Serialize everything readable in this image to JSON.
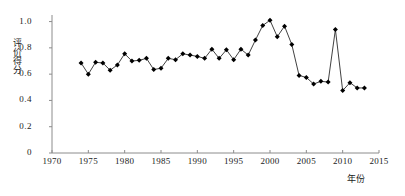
{
  "chart_data": {
    "type": "line",
    "title": "",
    "xlabel": "年份",
    "ylabel": "评价得分",
    "xlim": [
      1970,
      2015
    ],
    "ylim": [
      0,
      1.05
    ],
    "xticks": [
      1970,
      1975,
      1980,
      1985,
      1990,
      1995,
      2000,
      2005,
      2010,
      2015
    ],
    "xtick_labels": [
      "1970",
      "1975",
      "1980",
      "1985",
      "1990",
      "1995",
      "2000",
      "2005",
      "2010",
      "2015"
    ],
    "yticks": [
      0,
      0.2,
      0.4,
      0.6,
      0.8,
      1.0
    ],
    "ytick_labels": [
      "0",
      "0.2",
      "0.4",
      "0.6",
      "0.8",
      "1.0"
    ],
    "grid": false,
    "legend": null,
    "marker": "diamond",
    "marker_color": "#000000",
    "line_color": "#2b2b2b",
    "series": [
      {
        "name": "评价得分",
        "x": [
          1974,
          1975,
          1976,
          1977,
          1978,
          1979,
          1980,
          1981,
          1982,
          1983,
          1984,
          1985,
          1986,
          1987,
          1988,
          1989,
          1990,
          1991,
          1992,
          1993,
          1994,
          1995,
          1996,
          1997,
          1998,
          1999,
          2000,
          2001,
          2002,
          2003,
          2004,
          2005,
          2006,
          2007,
          2008,
          2009,
          2010,
          2011,
          2012,
          2013
        ],
        "values": [
          0.685,
          0.6,
          0.69,
          0.685,
          0.63,
          0.67,
          0.755,
          0.7,
          0.705,
          0.72,
          0.635,
          0.645,
          0.72,
          0.71,
          0.755,
          0.745,
          0.735,
          0.72,
          0.79,
          0.72,
          0.785,
          0.71,
          0.79,
          0.745,
          0.86,
          0.97,
          1.01,
          0.885,
          0.965,
          0.825,
          0.59,
          0.575,
          0.525,
          0.545,
          0.54,
          0.94,
          0.475,
          0.535,
          0.495,
          0.495
        ]
      }
    ]
  }
}
